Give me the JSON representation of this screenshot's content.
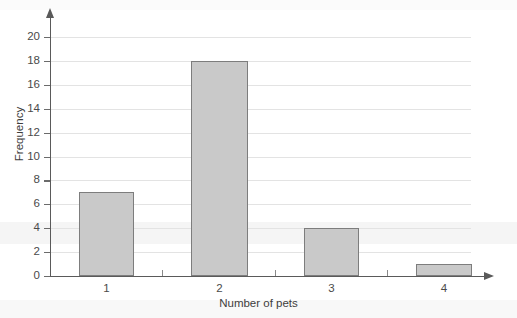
{
  "chart_data": {
    "type": "bar",
    "title": "",
    "categories": [
      "1",
      "2",
      "3",
      "4"
    ],
    "values": [
      7,
      18,
      4,
      1
    ],
    "xlabel": "Number of pets",
    "ylabel": "Frequency",
    "ylim": [
      0,
      20
    ],
    "yticks": [
      0,
      2,
      4,
      6,
      8,
      10,
      12,
      14,
      16,
      18,
      20
    ],
    "ytick_labels": [
      "0",
      "2",
      "4",
      "6",
      "8",
      "10",
      "12",
      "14",
      "16",
      "18",
      "20"
    ],
    "grid": true,
    "legend": "none",
    "bar_fill": "#c9c9c9",
    "bar_border": "#7d7d7d",
    "axis_color": "#5a5a5a",
    "grid_color": "#e3e3e3",
    "background": "#ffffff"
  }
}
